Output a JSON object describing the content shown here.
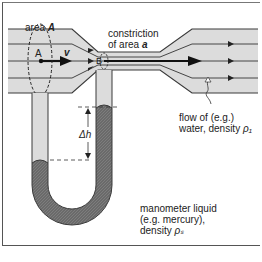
{
  "diagram": {
    "labels": {
      "area_A_prefix": "area ",
      "area_A_symbol": "A",
      "constriction_line1": "constriction",
      "constriction_line2_prefix": "of area ",
      "constriction_symbol": "a",
      "point_A": "A",
      "point_B": "B",
      "velocity": "v",
      "delta_h": "Δh",
      "flow_line1": "flow of (e.g.)",
      "flow_line2_prefix": "water, density ",
      "flow_symbol": "ρ₁",
      "manometer_line1": "manometer liquid",
      "manometer_line2": "(e.g. mercury),",
      "manometer_line3_prefix": "density ",
      "manometer_symbol": "ρₛ"
    },
    "colors": {
      "pipe_fill": "#dcdcdc",
      "pipe_stroke": "#3a3a3a",
      "mercury": "#6e6e6e",
      "text": "#222222"
    }
  }
}
